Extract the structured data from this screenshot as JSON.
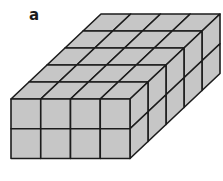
{
  "figure": {
    "label": "a",
    "dimensions": {
      "width_cubes": 4,
      "height_cubes": 2,
      "depth_cubes": 5
    },
    "total_cubes": 40,
    "colors": {
      "fill": "#c6c6c6",
      "stroke": "#1c1c1c",
      "background": "#ffffff"
    },
    "geometry": {
      "front_top_left": [
        11,
        99
      ],
      "cube_size": 29.75,
      "depth_offset": [
        18,
        -17
      ]
    }
  }
}
